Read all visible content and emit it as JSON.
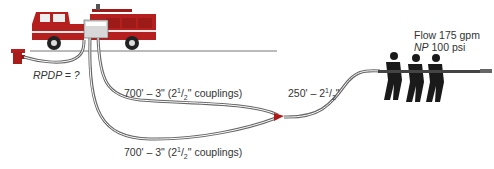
{
  "diagram": {
    "type": "fireground hose layout",
    "colors": {
      "hose": "#666666",
      "truck": "#b5201e",
      "ground_line": "#777777",
      "text": "#333333",
      "siamese": "#b01818"
    },
    "labels": {
      "rpdp": "RPDP = ?",
      "line1_prefix": "700' – 3\" (2",
      "line1_sup": "1",
      "line1_sub": "2",
      "line1_suffix": "\" couplings)",
      "line2_prefix": "700' – 3\" (2",
      "line2_sup": "1",
      "line2_sub": "2",
      "line2_suffix": "\" couplings)",
      "line3_prefix": "250' – 2",
      "line3_sup": "1",
      "line3_sub": "2",
      "line3_suffix": "\"",
      "flow": "Flow 175 gpm",
      "np_label": "NP",
      "np_value": "100 psi"
    },
    "elements": [
      {
        "name": "hydrant",
        "icon": "hydrant-icon"
      },
      {
        "name": "pumper engine",
        "icon": "fire-truck-icon"
      },
      {
        "name": "siamese wye",
        "icon": "siamese-icon"
      },
      {
        "name": "nozzle crew",
        "icon": "firefighters-icon"
      }
    ]
  }
}
